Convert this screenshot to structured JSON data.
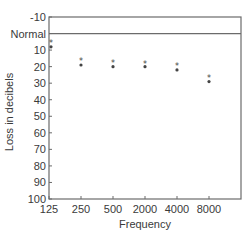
{
  "chart_data": {
    "type": "scatter",
    "title": "",
    "xlabel": "Frequency",
    "ylabel": "Loss in decibels",
    "categories": [
      "125",
      "250",
      "500",
      "2000",
      "4000",
      "8000"
    ],
    "y_ticks": [
      "-10",
      "Normal",
      "10",
      "20",
      "30",
      "40",
      "50",
      "60",
      "70",
      "80",
      "90",
      "100"
    ],
    "y_tick_values": [
      -10,
      0,
      10,
      20,
      30,
      40,
      50,
      60,
      70,
      80,
      90,
      100
    ],
    "ylim": [
      -10,
      100
    ],
    "y_inverted": true,
    "normal_line": 0,
    "normal_label": "Normal",
    "grid": false,
    "legend": "none",
    "series": [
      {
        "name": "star-marker",
        "marker": "*",
        "values": [
          5,
          16,
          17,
          18,
          19,
          26
        ]
      },
      {
        "name": "dot-marker",
        "marker": "•",
        "values": [
          8,
          19,
          20,
          20,
          22,
          29
        ]
      }
    ]
  },
  "colors": {
    "axis": "#6b6b6b",
    "marker": "#444444",
    "text": "#3a3a3a"
  }
}
